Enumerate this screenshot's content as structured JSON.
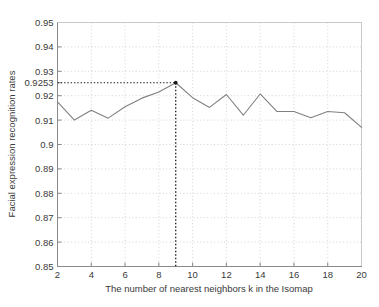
{
  "chart_data": {
    "type": "line",
    "title": "",
    "xlabel": "The number of nearest neighbors k in the Isomap",
    "ylabel": "Facial expression recognition rates",
    "xlim": [
      2,
      20
    ],
    "ylim": [
      0.85,
      0.95
    ],
    "grid": true,
    "legend": null,
    "x": [
      2,
      3,
      4,
      5,
      6,
      7,
      8,
      9,
      10,
      11,
      12,
      13,
      14,
      15,
      16,
      17,
      18,
      19,
      20
    ],
    "values": [
      0.9175,
      0.91,
      0.914,
      0.9108,
      0.9155,
      0.919,
      0.9215,
      0.9253,
      0.9192,
      0.9152,
      0.9205,
      0.912,
      0.9207,
      0.9135,
      0.9135,
      0.911,
      0.9135,
      0.913,
      0.907
    ],
    "series": [
      {
        "name": "Facial expression recognition rates",
        "values": [
          0.9175,
          0.91,
          0.914,
          0.9108,
          0.9155,
          0.919,
          0.9215,
          0.9253,
          0.9192,
          0.9152,
          0.9205,
          0.912,
          0.9207,
          0.9135,
          0.9135,
          0.911,
          0.9135,
          0.913,
          0.907
        ]
      }
    ],
    "xticks": [
      2,
      4,
      6,
      8,
      10,
      12,
      14,
      16,
      18,
      20
    ],
    "xtick_labels": [
      "2",
      "4",
      "6",
      "8",
      "10",
      "12",
      "14",
      "16",
      "18",
      "20"
    ],
    "yticks": [
      0.85,
      0.86,
      0.87,
      0.88,
      0.89,
      0.9,
      0.91,
      0.92,
      0.9253,
      0.93,
      0.94,
      0.95
    ],
    "ytick_labels": [
      "0.85",
      "0.86",
      "0.87",
      "0.88",
      "0.89",
      "0.9",
      "0.91",
      "0.92",
      "0.9253",
      "0.93",
      "0.94",
      "0.95"
    ],
    "annotations": [
      {
        "name": "peak-marker",
        "x": 9,
        "y": 0.9253,
        "label": "0.9253",
        "guide_lines": [
          "vertical-dotted-to-axis",
          "horizontal-dotted-to-axis"
        ]
      }
    ],
    "colors": {
      "line": "#808080",
      "grid": "#c8c8c8",
      "axis": "#808080",
      "guide": "#1a1a1a",
      "background": "#ffffff",
      "text": "#3a3a3a"
    }
  }
}
